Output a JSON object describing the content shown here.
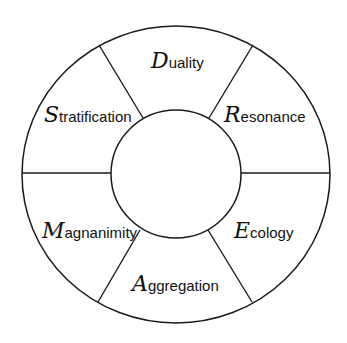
{
  "diagram": {
    "type": "segmented-ring",
    "center_label": "",
    "stroke_color": "#1a1a1a",
    "background": "#ffffff",
    "segments": [
      {
        "position": "top",
        "initial": "D",
        "rest": "uality",
        "label": "Duality"
      },
      {
        "position": "upper-right",
        "initial": "R",
        "rest": "esonance",
        "label": "Resonance"
      },
      {
        "position": "lower-right",
        "initial": "E",
        "rest": "cology",
        "label": "Ecology"
      },
      {
        "position": "bottom",
        "initial": "A",
        "rest": "ggregation",
        "label": "Aggregation"
      },
      {
        "position": "lower-left",
        "initial": "M",
        "rest": "agnanimity",
        "label": "Magnanimity"
      },
      {
        "position": "upper-left",
        "initial": "S",
        "rest": "tratification",
        "label": "Stratification"
      }
    ]
  }
}
